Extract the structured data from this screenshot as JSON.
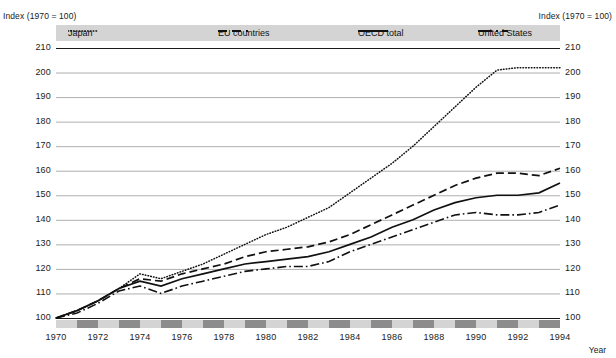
{
  "axis": {
    "unit_label_left": "Index (1970 = 100)",
    "unit_label_right": "Index (1970 = 100)",
    "year_caption": "Year"
  },
  "legend": {
    "items": [
      {
        "label": "Japan",
        "style": "dotted",
        "color": "#111111"
      },
      {
        "label": "EU countries",
        "style": "dashed",
        "color": "#111111"
      },
      {
        "label": "OECD total",
        "style": "solid",
        "color": "#111111"
      },
      {
        "label": "United States",
        "style": "dash-dot",
        "color": "#111111"
      }
    ],
    "band_color": "#d4d4d4"
  },
  "xaxis_band": {
    "dark_color": "#8c8c8c",
    "light_color": "#d4d4d4"
  },
  "chart_data": {
    "type": "line",
    "title": "",
    "xlabel": "Year",
    "ylabel": "Index (1970 = 100)",
    "xlim": [
      1970,
      1994
    ],
    "ylim": [
      100,
      210
    ],
    "yticks": [
      100,
      110,
      120,
      130,
      140,
      150,
      160,
      170,
      180,
      190,
      200,
      210
    ],
    "xticks": [
      1970,
      1972,
      1974,
      1976,
      1978,
      1980,
      1982,
      1984,
      1986,
      1988,
      1990,
      1992,
      1994
    ],
    "grid": true,
    "legend_position": "top",
    "x": [
      1970,
      1971,
      1972,
      1973,
      1974,
      1975,
      1976,
      1977,
      1978,
      1979,
      1980,
      1981,
      1982,
      1983,
      1984,
      1985,
      1986,
      1987,
      1988,
      1989,
      1990,
      1991,
      1992,
      1993,
      1994
    ],
    "series": [
      {
        "name": "Japan",
        "values": [
          100,
          103,
          107,
          112,
          118,
          116,
          119,
          122,
          126,
          130,
          134,
          137,
          141,
          145,
          151,
          157,
          163,
          170,
          178,
          186,
          194,
          201,
          202,
          202,
          202
        ]
      },
      {
        "name": "EU countries",
        "values": [
          100,
          103,
          107,
          112,
          116,
          115,
          118,
          120,
          122,
          125,
          127,
          128,
          129,
          131,
          134,
          138,
          142,
          146,
          150,
          154,
          157,
          159,
          159,
          158,
          161
        ]
      },
      {
        "name": "OECD total",
        "values": [
          100,
          103,
          107,
          112,
          115,
          113,
          116,
          118,
          120,
          122,
          123,
          124,
          125,
          127,
          130,
          133,
          137,
          140,
          144,
          147,
          149,
          150,
          150,
          151,
          155
        ]
      },
      {
        "name": "United States",
        "values": [
          100,
          102,
          106,
          111,
          113,
          110,
          113,
          115,
          117,
          119,
          120,
          121,
          121,
          123,
          127,
          130,
          133,
          136,
          139,
          142,
          143,
          142,
          142,
          143,
          146
        ]
      }
    ]
  }
}
